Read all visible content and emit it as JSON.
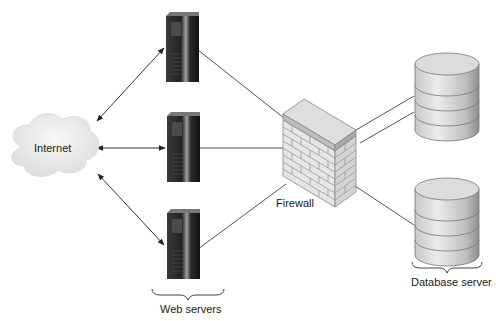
{
  "diagram": {
    "type": "network-architecture",
    "nodes": {
      "internet": {
        "label": "Internet",
        "shape": "cloud"
      },
      "web_servers": {
        "label": "Web servers",
        "count": 3,
        "shape": "tower-server"
      },
      "firewall": {
        "label": "Firewall",
        "shape": "brick-wall"
      },
      "database_server": {
        "label": "Database server",
        "count": 2,
        "shape": "cylinder"
      }
    },
    "edges": [
      {
        "from": "internet",
        "to": "web-server-1",
        "style": "double-arrow"
      },
      {
        "from": "internet",
        "to": "web-server-2",
        "style": "double-arrow"
      },
      {
        "from": "internet",
        "to": "web-server-3",
        "style": "double-arrow"
      },
      {
        "from": "web-server-1",
        "to": "firewall",
        "style": "line"
      },
      {
        "from": "web-server-2",
        "to": "firewall",
        "style": "line"
      },
      {
        "from": "web-server-3",
        "to": "firewall",
        "style": "line"
      },
      {
        "from": "firewall",
        "to": "database-1",
        "style": "line"
      },
      {
        "from": "firewall",
        "to": "database-1",
        "style": "line"
      },
      {
        "from": "firewall",
        "to": "database-2",
        "style": "line"
      }
    ],
    "colors": {
      "line": "#555555",
      "arrow": "#222222",
      "server_dark": "#1c1c1c",
      "server_light": "#9a9a9a",
      "brick": "#e4e4e4",
      "brick_line": "#9c9c9c",
      "cylinder": "#d8d8d8",
      "cloud": "#eeeeee"
    }
  }
}
